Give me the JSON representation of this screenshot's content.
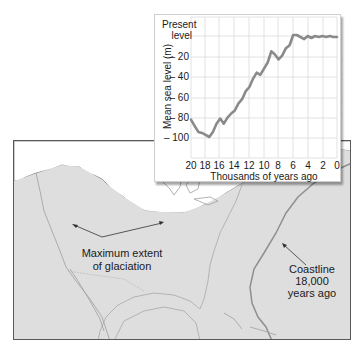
{
  "chart_data": {
    "type": "line",
    "title": "",
    "xlabel": "Thousands of years ago",
    "ylabel": "Mean sea level (m)",
    "x_ticks": [
      "20",
      "18",
      "16",
      "14",
      "12",
      "10",
      "8",
      "6",
      "4",
      "2",
      "0"
    ],
    "y_ticks": [
      "Present level",
      "– 20",
      "– 40",
      "– 60",
      "– 80",
      "– 100"
    ],
    "xlim": [
      20,
      0
    ],
    "ylim": [
      -120,
      0
    ],
    "grid": true,
    "series": [
      {
        "name": "Mean sea level",
        "color": "#8a8a8a",
        "x": [
          20,
          19.5,
          19,
          18.5,
          18,
          17.5,
          17,
          16.5,
          16,
          15.5,
          15,
          14.5,
          14,
          13.5,
          13,
          12.5,
          12,
          11.5,
          11,
          10.5,
          10,
          9.5,
          9,
          8.5,
          8,
          7.5,
          7,
          6.5,
          6,
          5.5,
          5,
          4.5,
          4,
          3.5,
          3,
          2.5,
          2,
          1.5,
          1,
          0.5,
          0
        ],
        "y": [
          -82,
          -88,
          -94,
          -95,
          -97,
          -99,
          -94,
          -86,
          -81,
          -86,
          -80,
          -76,
          -73,
          -66,
          -62,
          -54,
          -50,
          -42,
          -36,
          -38,
          -32,
          -26,
          -15,
          -18,
          -23,
          -19,
          -12,
          -9,
          1,
          1,
          -1,
          -3,
          0,
          -2,
          0,
          -1,
          0,
          -1,
          0,
          -1,
          -1
        ]
      }
    ]
  },
  "chart": {
    "y_label": "Mean sea level (m)",
    "present_label_1": "Present",
    "present_label_2": "level",
    "y_tick_20": "– 20",
    "y_tick_40": "– 40",
    "y_tick_60": "– 60",
    "y_tick_80": "– 80",
    "y_tick_100": "– 100",
    "x_ticks": [
      "20",
      "18",
      "16",
      "14",
      "12",
      "10",
      "8",
      "6",
      "4",
      "2",
      "0"
    ],
    "x_label": "Thousands of years ago"
  },
  "map": {
    "glaciation_label_1": "Maximum extent",
    "glaciation_label_2": "of glaciation",
    "coastline_label_1": "Coastline",
    "coastline_label_2": "18,000",
    "coastline_label_3": "years ago"
  }
}
